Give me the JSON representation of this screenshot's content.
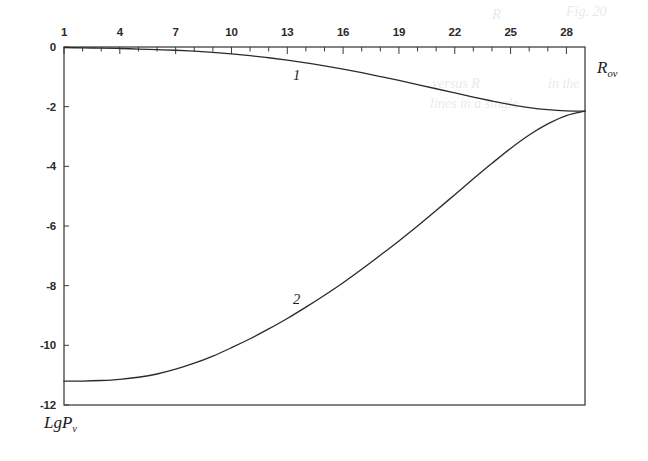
{
  "figure": {
    "axes": {
      "x_title": "R",
      "x_title_sub": "ov",
      "y_title": "LgP",
      "y_title_sub": "v",
      "x_tick_labels": [
        "1",
        "4",
        "7",
        "10",
        "13",
        "16",
        "19",
        "22",
        "25",
        "28"
      ],
      "y_tick_labels": [
        "0",
        "-2",
        "-4",
        "-6",
        "-8",
        "-10",
        "-12"
      ]
    },
    "curve_labels": [
      "1",
      "2"
    ],
    "ghosts": [
      "Fig. 20",
      "R",
      "versus R",
      "in the",
      "lines in a single"
    ]
  },
  "chart_data": {
    "type": "line",
    "title": "",
    "xlabel": "R_ov",
    "ylabel": "LgP_v",
    "xlim": [
      1,
      29
    ],
    "ylim": [
      -12,
      0
    ],
    "grid": false,
    "legend": "inline-curve-numbers",
    "x_ticks_major": [
      1,
      4,
      7,
      10,
      13,
      16,
      19,
      22,
      25,
      28
    ],
    "x_ticks_minor_step": 1,
    "y_ticks": [
      0,
      -2,
      -4,
      -6,
      -8,
      -10,
      -12
    ],
    "series": [
      {
        "name": "1",
        "label_x": 13.5,
        "label_y": -0.95,
        "x": [
          1,
          2,
          3,
          4,
          5,
          6,
          7,
          8,
          9,
          10,
          11,
          12,
          13,
          14,
          15,
          16,
          17,
          18,
          19,
          20,
          21,
          22,
          23,
          24,
          25,
          26,
          27,
          28,
          29
        ],
        "y": [
          -0.02,
          -0.03,
          -0.04,
          -0.05,
          -0.07,
          -0.09,
          -0.11,
          -0.14,
          -0.18,
          -0.23,
          -0.29,
          -0.36,
          -0.44,
          -0.53,
          -0.63,
          -0.74,
          -0.86,
          -0.99,
          -1.12,
          -1.26,
          -1.4,
          -1.54,
          -1.68,
          -1.81,
          -1.93,
          -2.03,
          -2.1,
          -2.14,
          -2.15
        ]
      },
      {
        "name": "2",
        "label_x": 13.5,
        "label_y": -8.45,
        "x": [
          1,
          2,
          3,
          4,
          5,
          6,
          7,
          8,
          9,
          10,
          11,
          12,
          13,
          14,
          15,
          16,
          17,
          18,
          19,
          20,
          21,
          22,
          23,
          24,
          25,
          26,
          27,
          28,
          29
        ],
        "y": [
          -11.2,
          -11.2,
          -11.18,
          -11.14,
          -11.07,
          -10.96,
          -10.8,
          -10.6,
          -10.36,
          -10.08,
          -9.78,
          -9.45,
          -9.1,
          -8.72,
          -8.32,
          -7.9,
          -7.45,
          -6.98,
          -6.5,
          -6.0,
          -5.48,
          -4.95,
          -4.42,
          -3.9,
          -3.4,
          -2.95,
          -2.58,
          -2.3,
          -2.15
        ]
      }
    ]
  }
}
